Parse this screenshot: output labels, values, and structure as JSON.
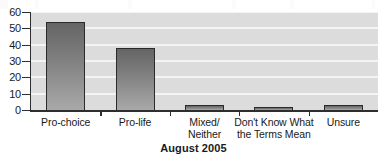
{
  "chart_data": {
    "type": "bar",
    "title": "",
    "subtitle": "",
    "xlabel": "August 2005",
    "ylabel": "",
    "ylim": [
      0,
      60
    ],
    "ytick_step": 10,
    "ytick_labels": [
      "60",
      "50",
      "40",
      "30",
      "20",
      "10",
      "0"
    ],
    "ytick_values": [
      60,
      50,
      40,
      30,
      20,
      10,
      0
    ],
    "grid": true,
    "grid_orientation": "horizontal",
    "legend": false,
    "legend_position": "none",
    "categories": [
      "Pro-choice",
      "Pro-life",
      "Mixed/\nNeither",
      "Don't Know What\nthe Terms Mean",
      "Unsure"
    ],
    "values": [
      54,
      38,
      3,
      2,
      3
    ],
    "annotations": []
  },
  "colors": {
    "plot_background": "#dcdcdc",
    "gridline": "#f4f4f4",
    "bar_top": "#656565",
    "bar_bottom": "#a9a9a9",
    "bar_outline": "#2b2b2b",
    "axis": "#2e2e2e",
    "text": "#1a1a1a",
    "page_background": "#ffffff"
  }
}
